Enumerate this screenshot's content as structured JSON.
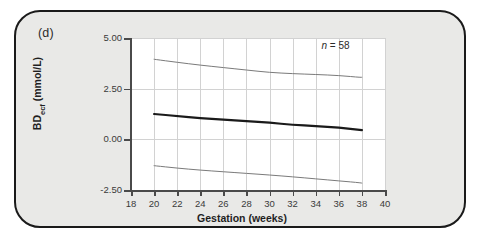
{
  "figure": {
    "panel_label": "(d)",
    "background_color": "#e9e9e7",
    "border_color": "#1a1a1a",
    "plot_background": "#ffffff"
  },
  "annotation": {
    "n_prefix": "n",
    "n_equals": " = ",
    "n_value": "58",
    "full_text": "n = 58"
  },
  "chart_data": {
    "type": "line",
    "title": "",
    "subtitle": "",
    "xlabel": "Gestation (weeks)",
    "ylabel": "BD ecf (mmol/L)",
    "ylabel_base": "BD",
    "ylabel_sub": "ecf",
    "ylabel_units": " (mmol/L)",
    "xlim": [
      18,
      40
    ],
    "ylim": [
      -2.5,
      5.0
    ],
    "xticks": [
      18,
      20,
      22,
      24,
      26,
      28,
      30,
      32,
      34,
      36,
      38,
      40
    ],
    "xtick_labels": [
      "18",
      "20",
      "22",
      "24",
      "26",
      "28",
      "30",
      "32",
      "34",
      "36",
      "38",
      "40"
    ],
    "yticks": [
      -2.5,
      0.0,
      2.5,
      5.0
    ],
    "ytick_labels": [
      "-2.50",
      "0.00",
      "2.50",
      "5.00"
    ],
    "grid": true,
    "grid_color": "#d2d2d2",
    "legend": "none",
    "annotations": [
      {
        "text": "n = 58",
        "x": 34.5,
        "y": 4.55
      }
    ],
    "x": [
      20,
      22,
      24,
      26,
      28,
      30,
      32,
      34,
      36,
      38
    ],
    "series": [
      {
        "name": "upper limit (97.5th centile)",
        "color": "#7a7a7a",
        "width": 1.0,
        "values": [
          3.95,
          3.8,
          3.66,
          3.54,
          3.42,
          3.3,
          3.24,
          3.2,
          3.15,
          3.05
        ]
      },
      {
        "name": "mean",
        "color": "#1a1a1a",
        "width": 2.2,
        "values": [
          1.25,
          1.15,
          1.05,
          0.97,
          0.9,
          0.82,
          0.72,
          0.65,
          0.58,
          0.45
        ]
      },
      {
        "name": "lower limit (2.5th centile)",
        "color": "#7a7a7a",
        "width": 1.0,
        "values": [
          -1.3,
          -1.42,
          -1.52,
          -1.6,
          -1.68,
          -1.76,
          -1.85,
          -1.95,
          -2.05,
          -2.15
        ]
      }
    ]
  }
}
